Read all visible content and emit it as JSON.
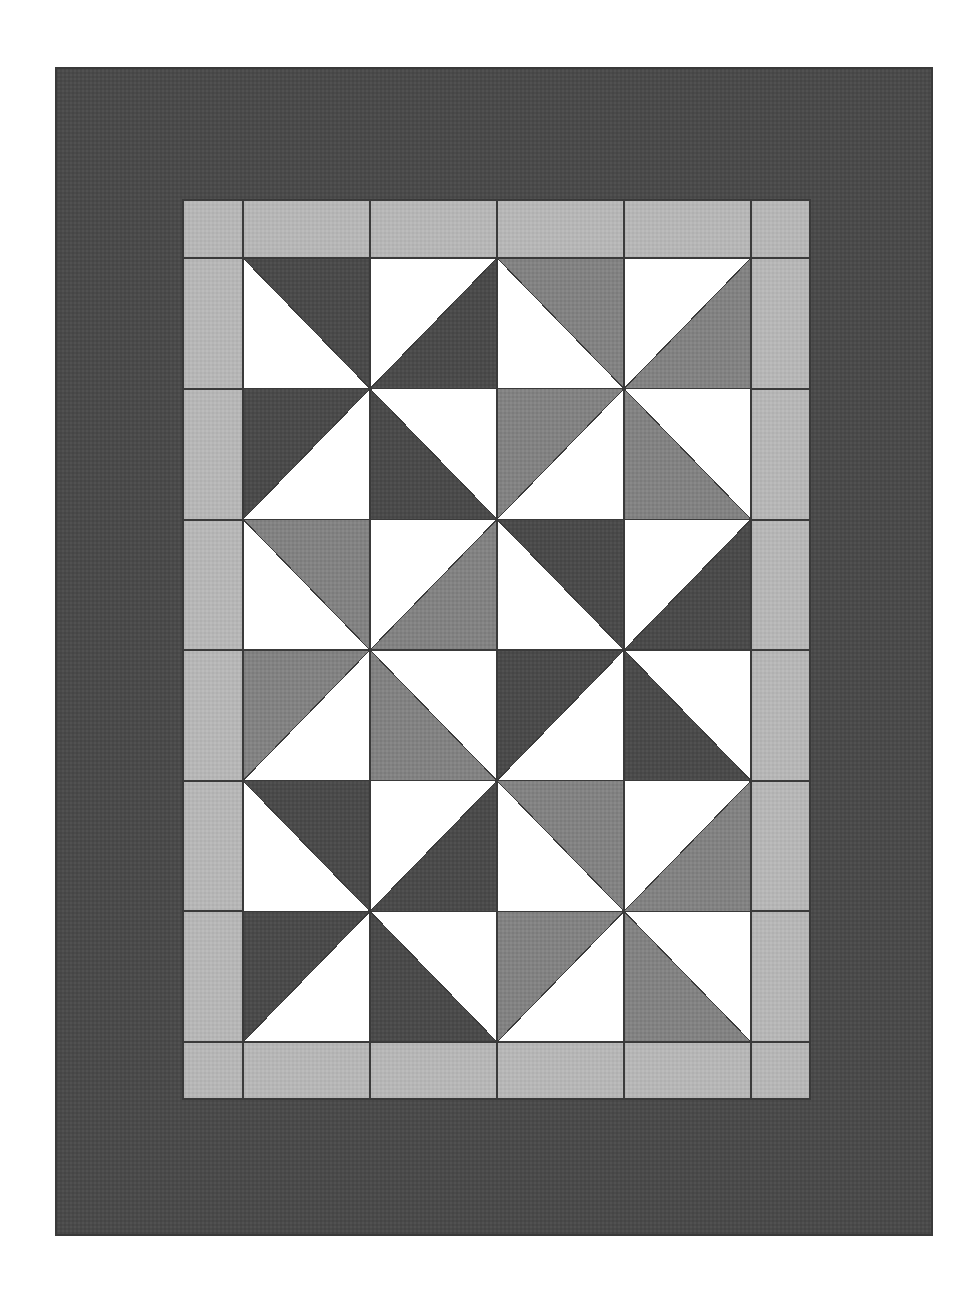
{
  "artwork": {
    "title": "Pinwheel Patchwork Quilt",
    "kind": "quilt-diagram",
    "canvas": {
      "width": 980,
      "height": 1302,
      "background": "#ffffff"
    }
  },
  "palette": {
    "background": "#ffffff",
    "outer_border": "#4a4a4a",
    "inner_border": "#b6b6b6",
    "dark_fabric": "#4f4f4f",
    "medium_fabric": "#828282",
    "light_fabric": "#ffffff",
    "seam_line": "#3a3a3a"
  },
  "layout": {
    "quilt_rect": {
      "x": 56,
      "y": 68,
      "width": 876,
      "height": 1167
    },
    "outer_border_width_top": 132,
    "outer_border_width_left": 127,
    "inner_border_rect": {
      "x": 183,
      "y": 200,
      "width": 627,
      "height": 899
    },
    "inner_border_band": 59,
    "center_rect": {
      "x": 243,
      "y": 258,
      "width": 508,
      "height": 784
    },
    "center_grid": {
      "cols": 4,
      "rows": 6,
      "cell_width": 127,
      "cell_height": 130.6667
    },
    "blocks": {
      "cols": 2,
      "rows": 3,
      "name": "pinwheel"
    }
  },
  "inner_border_segments": {
    "top_row_divisions": [
      183,
      243,
      370,
      497,
      624,
      751,
      810
    ],
    "left_col_divisions": [
      200,
      258,
      389,
      520,
      650,
      781,
      911,
      1042,
      1099
    ],
    "note": "border squares and rectangles in light fabric with seam outlines"
  },
  "center_cells": {
    "legend": {
      "d": "dark_fabric",
      "m": "medium_fabric",
      "w": "light_fabric",
      "orientation": "tl = triangle occupies top-left half, tr = top-right, bl = bottom-left, br = bottom-right"
    },
    "rows": [
      [
        {
          "fill": "d",
          "corner": "tr"
        },
        {
          "fill": "d",
          "corner": "br"
        },
        {
          "fill": "m",
          "corner": "tr"
        },
        {
          "fill": "m",
          "corner": "br"
        }
      ],
      [
        {
          "fill": "d",
          "corner": "tl"
        },
        {
          "fill": "d",
          "corner": "bl"
        },
        {
          "fill": "m",
          "corner": "tl"
        },
        {
          "fill": "m",
          "corner": "bl"
        }
      ],
      [
        {
          "fill": "m",
          "corner": "tr"
        },
        {
          "fill": "m",
          "corner": "br"
        },
        {
          "fill": "d",
          "corner": "tr"
        },
        {
          "fill": "d",
          "corner": "br"
        }
      ],
      [
        {
          "fill": "m",
          "corner": "tl"
        },
        {
          "fill": "m",
          "corner": "bl"
        },
        {
          "fill": "d",
          "corner": "tl"
        },
        {
          "fill": "d",
          "corner": "bl"
        }
      ],
      [
        {
          "fill": "d",
          "corner": "tr"
        },
        {
          "fill": "d",
          "corner": "br"
        },
        {
          "fill": "m",
          "corner": "tr"
        },
        {
          "fill": "m",
          "corner": "br"
        }
      ],
      [
        {
          "fill": "d",
          "corner": "tl"
        },
        {
          "fill": "d",
          "corner": "bl"
        },
        {
          "fill": "m",
          "corner": "tl"
        },
        {
          "fill": "m",
          "corner": "bl"
        }
      ]
    ]
  }
}
